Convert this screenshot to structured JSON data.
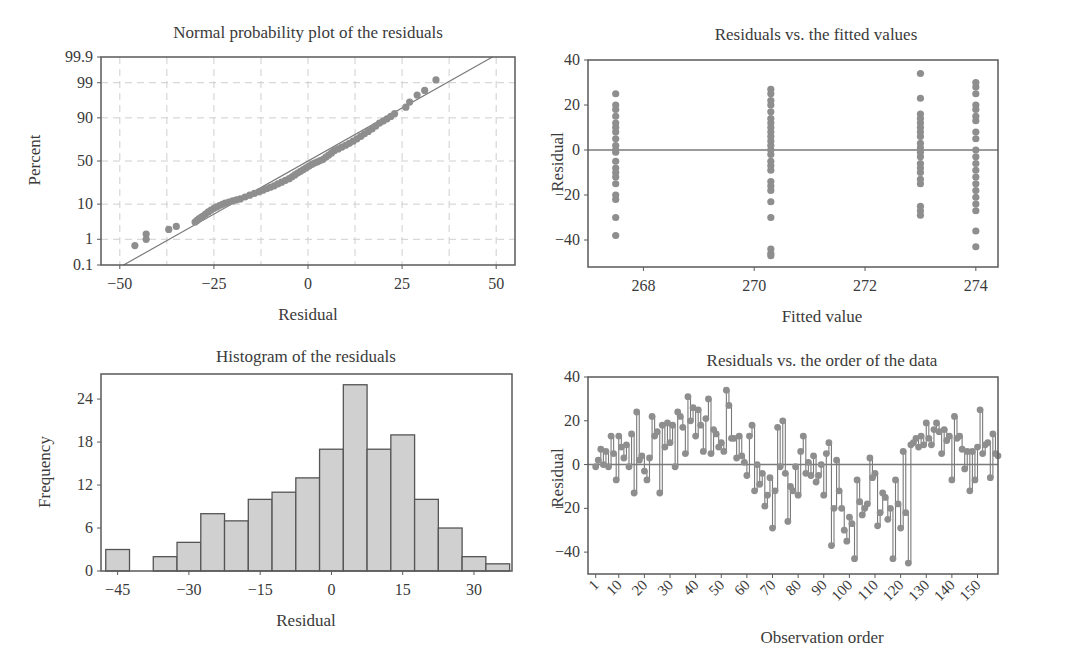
{
  "chart_data": [
    {
      "id": "normal-probability",
      "type": "scatter",
      "title": "Normal probability plot of the residuals",
      "xlabel": "Residual",
      "ylabel": "Percent",
      "xlim": [
        -55,
        55
      ],
      "xticks": [
        -50,
        -25,
        0,
        25,
        50
      ],
      "yticks": [
        "0.1",
        "1",
        "10",
        "50",
        "90",
        "99",
        "99.9"
      ],
      "ytick_values": [
        0.1,
        1,
        10,
        50,
        90,
        99,
        99.9
      ],
      "grid": true,
      "reference_line": {
        "from": [
          -49,
          0.1
        ],
        "to": [
          49,
          99.9
        ]
      },
      "points_approx": [
        {
          "x": -46,
          "p": 0.6
        },
        {
          "x": -43,
          "p": 1.0
        },
        {
          "x": -43,
          "p": 1.5
        },
        {
          "x": -37,
          "p": 2.1
        },
        {
          "x": -35,
          "p": 2.6
        },
        {
          "x": -30,
          "p": 3.5
        },
        {
          "x": -28,
          "p": 5.0
        },
        {
          "x": -25,
          "p": 8.0
        },
        {
          "x": -22,
          "p": 10.5
        },
        {
          "x": -18,
          "p": 13.0
        },
        {
          "x": -13,
          "p": 18.0
        },
        {
          "x": -9,
          "p": 23.0
        },
        {
          "x": -5,
          "p": 30.0
        },
        {
          "x": -2,
          "p": 38.0
        },
        {
          "x": 1,
          "p": 46.0
        },
        {
          "x": 4,
          "p": 52.0
        },
        {
          "x": 7,
          "p": 62.0
        },
        {
          "x": 11,
          "p": 70.0
        },
        {
          "x": 15,
          "p": 79.0
        },
        {
          "x": 19,
          "p": 87.0
        },
        {
          "x": 23,
          "p": 92.0
        },
        {
          "x": 26,
          "p": 94.5
        },
        {
          "x": 27,
          "p": 96.0
        },
        {
          "x": 29,
          "p": 97.5
        },
        {
          "x": 31,
          "p": 98.2
        },
        {
          "x": 34,
          "p": 99.2
        }
      ]
    },
    {
      "id": "residuals-vs-fitted",
      "type": "scatter",
      "title": "Residuals vs. the fitted values",
      "xlabel": "Fitted value",
      "ylabel": "Residual",
      "xlim": [
        267.0,
        274.4
      ],
      "ylim": [
        -52,
        40
      ],
      "xticks": [
        268,
        270,
        272,
        274
      ],
      "yticks": [
        40,
        20,
        0,
        -20,
        -40
      ],
      "reference_line_y": 0,
      "groups": [
        {
          "fitted": 267.5,
          "residuals": [
            25,
            20,
            18,
            15,
            12,
            10,
            8,
            5,
            2,
            0,
            -1,
            -5,
            -8,
            -10,
            -12,
            -15,
            -20,
            -22,
            -30,
            -38
          ]
        },
        {
          "fitted": 270.3,
          "residuals": [
            27,
            25,
            22,
            20,
            17,
            14,
            12,
            10,
            8,
            6,
            4,
            2,
            0,
            -2,
            -5,
            -7,
            -9,
            -14,
            -16,
            -18,
            -23,
            -30,
            -44,
            -46,
            -47
          ]
        },
        {
          "fitted": 273.0,
          "residuals": [
            34,
            23,
            16,
            14,
            12,
            10,
            8,
            6,
            3,
            1,
            -1,
            -3,
            -6,
            -8,
            -10,
            -13,
            -15,
            -25,
            -27,
            -29
          ]
        },
        {
          "fitted": 274.0,
          "residuals": [
            30,
            28,
            25,
            20,
            18,
            15,
            13,
            8,
            5,
            0,
            -3,
            -6,
            -9,
            -12,
            -15,
            -18,
            -21,
            -24,
            -27,
            -36,
            -43
          ]
        }
      ]
    },
    {
      "id": "histogram",
      "type": "bar",
      "title": "Histogram of the residuals",
      "xlabel": "Residual",
      "ylabel": "Frequency",
      "bin_width": 5,
      "categories": [
        -45,
        -40,
        -35,
        -30,
        -25,
        -20,
        -15,
        -10,
        -5,
        0,
        5,
        10,
        15,
        20,
        25,
        30,
        35
      ],
      "values": [
        3,
        0,
        2,
        4,
        8,
        7,
        10,
        11,
        13,
        17,
        26,
        17,
        19,
        10,
        6,
        2,
        1
      ],
      "xticks": [
        -45,
        -30,
        -15,
        0,
        15,
        30
      ],
      "yticks": [
        0,
        6,
        12,
        18,
        24
      ],
      "ylim": [
        0,
        27.5
      ],
      "xlim": [
        -48.5,
        38
      ]
    },
    {
      "id": "residuals-vs-order",
      "type": "line",
      "title": "Residuals vs. the order of the data",
      "xlabel": "Observation order",
      "ylabel": "Residual",
      "xlim": [
        -2,
        158
      ],
      "ylim": [
        -50,
        40
      ],
      "xticks": [
        1,
        10,
        20,
        30,
        40,
        50,
        60,
        70,
        80,
        90,
        100,
        110,
        120,
        130,
        140,
        150
      ],
      "yticks": [
        40,
        20,
        0,
        -20,
        -40
      ],
      "reference_line_y": 0,
      "series_approx": [
        -1,
        2,
        7,
        0,
        6,
        -1,
        13,
        5,
        -7,
        13,
        8,
        3,
        9,
        -1,
        14,
        -13,
        24,
        2,
        4,
        -3,
        -7,
        3,
        22,
        13,
        15,
        -13,
        18,
        8,
        19,
        10,
        18,
        -1,
        24,
        22,
        17,
        5,
        31,
        20,
        26,
        13,
        25,
        18,
        6,
        21,
        30,
        5,
        16,
        14,
        8,
        10,
        6,
        34,
        27,
        12,
        12,
        3,
        13,
        4,
        1,
        -5,
        13,
        18,
        -12,
        0,
        -9,
        -4,
        -19,
        -14,
        -6,
        -29,
        -12,
        17,
        -1,
        20,
        -4,
        -26,
        -10,
        -12,
        -1,
        -14,
        6,
        13,
        -4,
        1,
        -5,
        4,
        -8,
        -5,
        0,
        -14,
        5,
        10,
        -37,
        -20,
        2,
        -12,
        -20,
        -30,
        -35,
        -24,
        -27,
        -43,
        -7,
        -17,
        -23,
        -20,
        -18,
        3,
        -6,
        -4,
        -28,
        -22,
        -13,
        -15,
        -25,
        -20,
        -43,
        -7,
        -18,
        -29,
        6,
        -22,
        -45,
        9,
        10,
        12,
        8,
        13,
        9,
        19,
        12,
        9,
        16,
        19,
        15,
        5,
        16,
        11,
        13,
        -7,
        22,
        12,
        13,
        7,
        -2,
        6,
        -12,
        6,
        -7,
        8,
        25,
        5,
        9,
        10,
        -6,
        14,
        5,
        4
      ]
    }
  ],
  "style": {
    "point_color": "#8e8e8e",
    "line_color": "#7a7a7a",
    "bar_fill": "#d0d0d0",
    "bar_edge": "#555555",
    "frame_color": "#5a5a5a",
    "grid_color": "#cfcfcf"
  }
}
